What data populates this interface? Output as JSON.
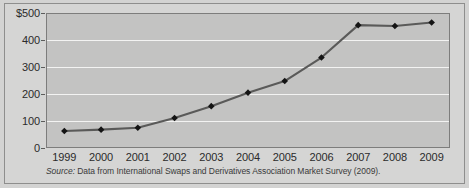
{
  "figure": {
    "source_note_prefix": "Source:",
    "source_note": " Data from International Swaps and Derivatives Association Market Survey (2009)."
  },
  "chart_data": {
    "type": "line",
    "title": "",
    "xlabel": "",
    "ylabel": "",
    "categories": [
      "1999",
      "2000",
      "2001",
      "2002",
      "2003",
      "2004",
      "2005",
      "2006",
      "2007",
      "2008",
      "2009"
    ],
    "values": [
      63,
      68,
      75,
      111,
      155,
      205,
      248,
      335,
      455,
      452,
      465
    ],
    "ylim": [
      0,
      500
    ],
    "yticks": [
      0,
      100,
      200,
      300,
      400,
      500
    ],
    "ytick_labels": [
      "0",
      "100",
      "200",
      "300",
      "400",
      "$500"
    ],
    "grid": true,
    "legend": "none",
    "marker": "diamond",
    "line_color": "#5a5a59",
    "marker_color": "#141414",
    "plot_background": "#c3c3c2",
    "gridline_color": "#f3f3f2",
    "figure_background": "#d5d5d4"
  }
}
